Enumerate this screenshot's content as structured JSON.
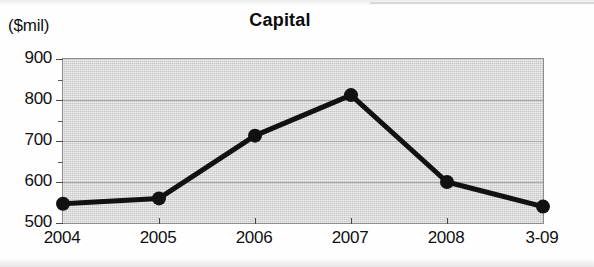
{
  "axis_unit_label": "($mil)",
  "chart_data": {
    "type": "line",
    "title": "Capital",
    "xlabel": "",
    "ylabel": "($mil)",
    "categories": [
      "2004",
      "2005",
      "2006",
      "2007",
      "2008",
      "3-09"
    ],
    "values": [
      547,
      560,
      713,
      812,
      600,
      540
    ],
    "series": [
      {
        "name": "Capital",
        "values": [
          547,
          560,
          713,
          812,
          600,
          540
        ]
      }
    ],
    "ylim": [
      500,
      900
    ],
    "ytick_labels": [
      "900",
      "800",
      "700",
      "600",
      "500"
    ],
    "ytick_values": [
      900,
      800,
      700,
      600,
      500
    ],
    "yminor_tick_values": [
      850,
      750,
      650,
      550
    ],
    "ytick_interval": 100,
    "yminor_tick_interval": 50,
    "grid": true,
    "legend": false,
    "legend_position": "none",
    "marker": "filled-circle",
    "line_color": "#111111",
    "marker_color": "#111111",
    "plot_background_color": "#d6d6d6",
    "gridline_color": "#a9a9a9",
    "axis_color": "#8d8d8d"
  }
}
